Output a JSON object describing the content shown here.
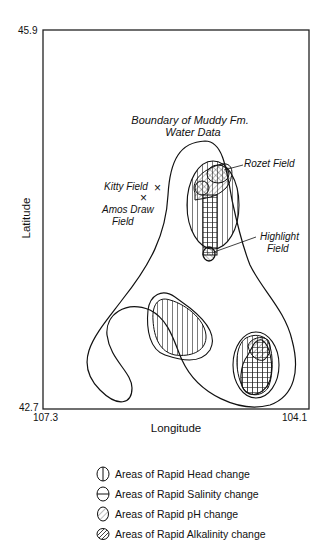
{
  "map": {
    "title": "Boundary of Muddy Fm. Water Data",
    "boundary_label_line1": "Boundary of Muddy Fm.",
    "boundary_label_line2": "Water Data",
    "axes": {
      "xlabel": "Longitude",
      "ylabel": "Latitude",
      "x_min_label": "107.3",
      "x_max_label": "104.1",
      "y_min_label": "42.7",
      "y_max_label": "45.9"
    },
    "fields": {
      "kitty": "Kitty Field",
      "amos_line1": "Amos Draw",
      "amos_line2": "Field",
      "rozet": "Rozet Field",
      "highlight_line1": "Highlight",
      "highlight_line2": "Field"
    },
    "marker_symbol": "×",
    "legend": [
      {
        "icon": "vertical-hatch-icon",
        "label": "Areas of Rapid Head change"
      },
      {
        "icon": "horizontal-hatch-icon",
        "label": "Areas of Rapid Salinity change"
      },
      {
        "icon": "diagonal-hatch-icon",
        "label": "Areas of Rapid pH change"
      },
      {
        "icon": "diagonal-fine-hatch-icon",
        "label": "Areas of Rapid Alkalinity change"
      }
    ]
  }
}
